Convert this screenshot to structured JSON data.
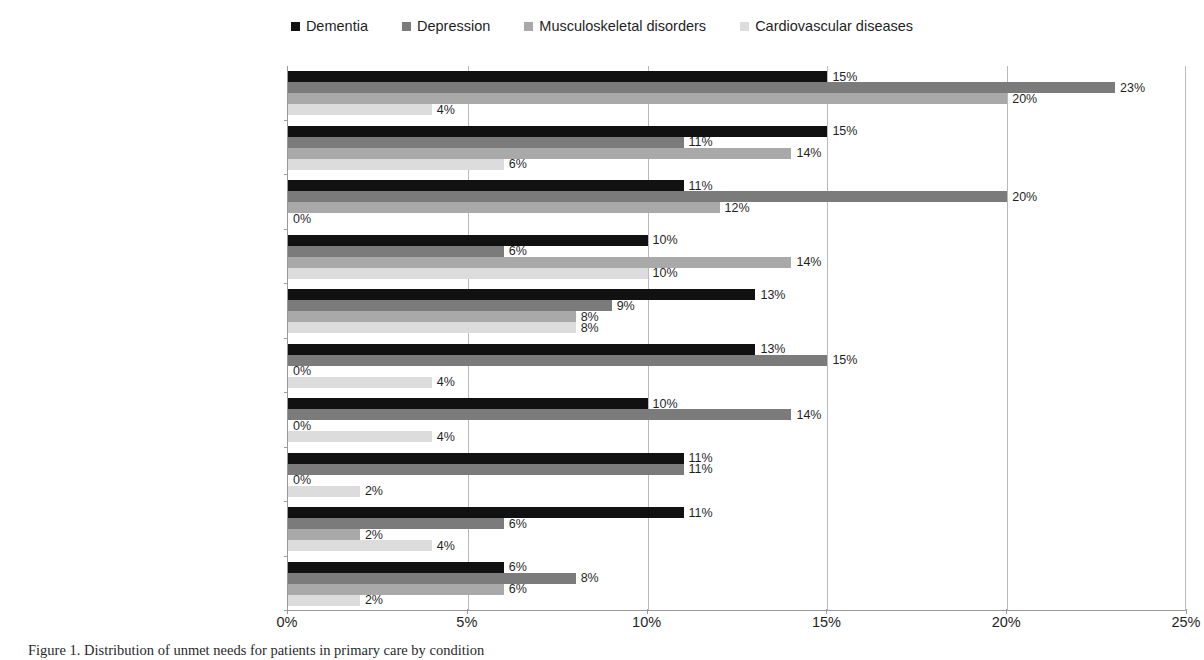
{
  "legend": {
    "entries": [
      {
        "label": "Dementia",
        "color": "#111111"
      },
      {
        "label": "Depression",
        "color": "#7b7b7b"
      },
      {
        "label": "Musculoskeletal disorders",
        "color": "#a9a9a9"
      },
      {
        "label": "Cardiovascular diseases",
        "color": "#dcdcdc"
      }
    ]
  },
  "caption": {
    "text": "Figure 1. Distribution of unmet needs for patients in primary care by condition"
  },
  "chart_data": {
    "type": "bar",
    "orientation": "horizontal",
    "title": "",
    "xlabel": "",
    "ylabel": "",
    "xlim": [
      0,
      25
    ],
    "xticks": [
      "0%",
      "5%",
      "10%",
      "15%",
      "20%",
      "25%"
    ],
    "xtick_values": [
      0,
      5,
      10,
      15,
      20,
      25
    ],
    "grid": true,
    "grid_axis": "x",
    "value_suffix": "%",
    "legend_position": "top-center",
    "categories": [
      "Physical health",
      "Information",
      "Mobility",
      "Eyesight/hearing/communication",
      "Accommodation",
      "Psychological distress",
      "Behaviour",
      "Company",
      "Daytime activities",
      "Falls"
    ],
    "series": [
      {
        "name": "Dementia",
        "color": "#111111",
        "values": [
          15,
          15,
          11,
          10,
          13,
          13,
          10,
          11,
          11,
          6
        ],
        "labels": [
          "15%",
          "15%",
          "11%",
          "10%",
          "13%",
          "13%",
          "10%",
          "11%",
          "11%",
          "6%"
        ]
      },
      {
        "name": "Depression",
        "color": "#7b7b7b",
        "values": [
          23,
          11,
          20,
          6,
          9,
          15,
          14,
          11,
          6,
          8
        ],
        "labels": [
          "23%",
          "11%",
          "20%",
          "6%",
          "9%",
          "15%",
          "14%",
          "11%",
          "6%",
          "8%"
        ]
      },
      {
        "name": "Musculoskeletal disorders",
        "color": "#a9a9a9",
        "values": [
          20,
          14,
          12,
          14,
          8,
          0,
          0,
          0,
          2,
          6
        ],
        "labels": [
          "20%",
          "14%",
          "12%",
          "14%",
          "8%",
          "0%",
          "0%",
          "0%",
          "2%",
          "6%"
        ]
      },
      {
        "name": "Cardiovascular diseases",
        "color": "#dcdcdc",
        "values": [
          4,
          6,
          0,
          10,
          8,
          4,
          4,
          2,
          4,
          2
        ],
        "labels": [
          "4%",
          "6%",
          "0%",
          "10%",
          "8%",
          "4%",
          "4%",
          "2%",
          "4%",
          "2%"
        ]
      }
    ]
  }
}
